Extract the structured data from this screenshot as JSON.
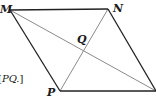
{
  "diagram": {
    "type": "parallelogram-with-diagonals",
    "vertices": {
      "M": {
        "label": "M",
        "x": 10,
        "y": 10
      },
      "N": {
        "label": "N",
        "x": 108,
        "y": 9
      },
      "R": {
        "label": "",
        "x": 156,
        "y": 91
      },
      "P": {
        "label": "P",
        "x": 60,
        "y": 91
      }
    },
    "intersection": {
      "label": "Q",
      "x": 84,
      "y": 50
    },
    "edges": [
      [
        "M",
        "N"
      ],
      [
        "N",
        "R"
      ],
      [
        "R",
        "P"
      ],
      [
        "P",
        "M"
      ]
    ],
    "diagonals": [
      [
        "M",
        "R"
      ],
      [
        "N",
        "P"
      ]
    ],
    "colors": {
      "edge": "#222222",
      "diagonal": "#8a8a8a",
      "text": "#1a1a1a",
      "background": "#ffffff"
    }
  },
  "caption": {
    "prefix": "[",
    "text": "PQ.",
    "suffix": "]"
  },
  "labels": {
    "M": "M",
    "N": "N",
    "P": "P",
    "Q": "Q"
  }
}
